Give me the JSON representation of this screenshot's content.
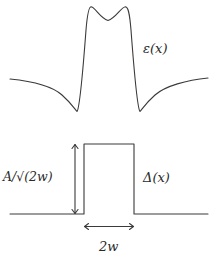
{
  "diagram": {
    "colors": {
      "background": "#ffffff",
      "line": "#3a3a3a",
      "text": "#2a2a2a"
    },
    "top_plot": {
      "curve_name": "epsilon-curve",
      "label": "ε(x)",
      "description": "symmetric curve with two sharp peaks and a central dip, flanked by sharp minima and slowly rising tails"
    },
    "bottom_plot": {
      "curve_name": "delta-step-function",
      "label": "Δ(x)",
      "height_label": "A/√(2w)",
      "width_label": "2w",
      "description": "rectangular pulse of width 2w and height A/√(2w)"
    }
  }
}
